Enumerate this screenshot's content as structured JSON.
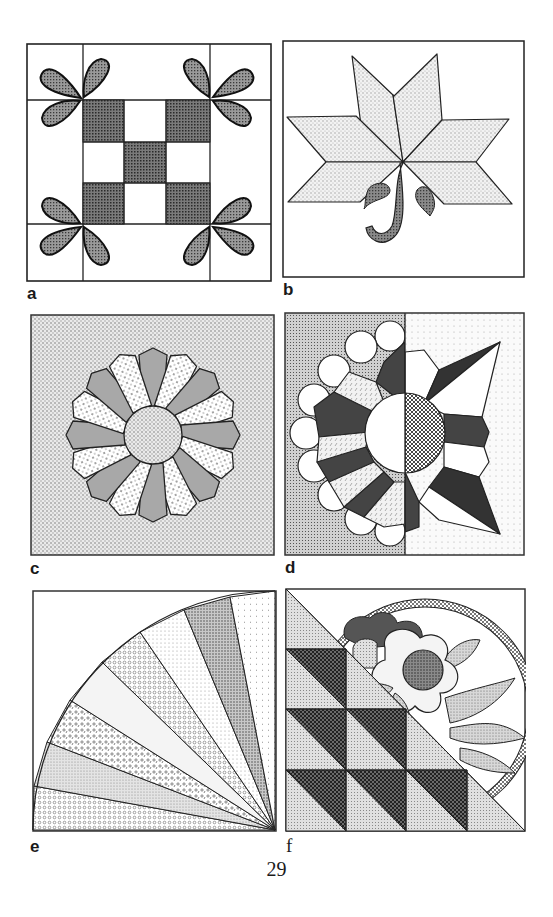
{
  "page": {
    "page_number": "29",
    "figures": [
      {
        "id": "a",
        "label": "a",
        "subject": "quilt block: nine-patch with teardrop appliqué leaves"
      },
      {
        "id": "b",
        "label": "b",
        "subject": "quilt block: eight-point diamond star flower with stem and two leaves"
      },
      {
        "id": "c",
        "label": "c",
        "subject": "quilt block: Dresden plate with center circle"
      },
      {
        "id": "d",
        "label": "d",
        "subject": "quilt block: split sunflower / scalloped Dresden plate half and pointed star half"
      },
      {
        "id": "e",
        "label": "e",
        "subject": "quilt block: quarter fan with pieced blades"
      },
      {
        "id": "f",
        "label": "f",
        "subject": "quilt block: half-square triangles with appliqué flower and hoop"
      }
    ]
  },
  "colors": {
    "ink": "#1a1a1a",
    "dark_fill": "#4a4a4a",
    "mid_fill": "#8c8c8c",
    "light_fill": "#b0b0b0",
    "stipple_bg": "#d8d8d8",
    "paper": "#ffffff"
  }
}
